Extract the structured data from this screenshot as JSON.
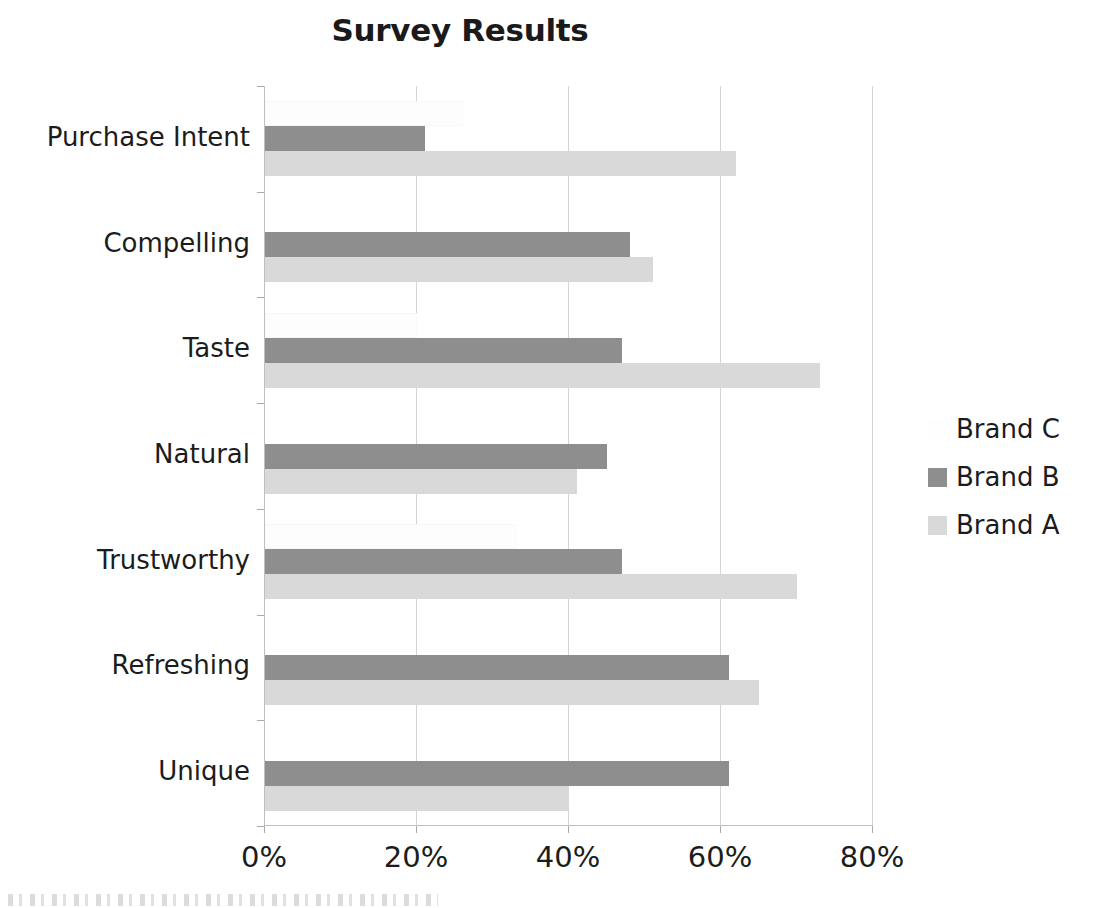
{
  "chart_data": {
    "type": "bar",
    "orientation": "horizontal",
    "title": "Survey Results",
    "xlabel": "",
    "ylabel": "",
    "xlim": [
      0,
      80
    ],
    "xticks": [
      0,
      20,
      40,
      60,
      80
    ],
    "xtick_labels": [
      "0%",
      "20%",
      "40%",
      "60%",
      "80%"
    ],
    "grid": true,
    "legend_position": "right",
    "value_suffix": "%",
    "categories": [
      "Purchase Intent",
      "Compelling",
      "Taste",
      "Natural",
      "Trustworthy",
      "Refreshing",
      "Unique"
    ],
    "series": [
      {
        "name": "Brand C",
        "color": "#fdfdfd",
        "values": [
          26,
          0,
          20,
          0,
          33,
          0,
          0
        ]
      },
      {
        "name": "Brand B",
        "color": "#8e8e8e",
        "values": [
          21,
          48,
          47,
          45,
          47,
          61,
          61
        ]
      },
      {
        "name": "Brand A",
        "color": "#d9d9d9",
        "values": [
          62,
          51,
          73,
          41,
          70,
          65,
          40
        ]
      }
    ],
    "legend": [
      {
        "label": "Brand C",
        "swatch": "white"
      },
      {
        "label": "Brand B",
        "swatch": "medium-gray"
      },
      {
        "label": "Brand A",
        "swatch": "light-gray"
      }
    ]
  }
}
